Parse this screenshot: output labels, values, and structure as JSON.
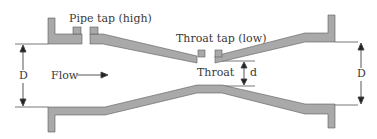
{
  "diagram": {
    "type": "venturi-meter-cross-section",
    "labels": {
      "pipe_tap": "Pipe tap (high)",
      "throat_tap": "Throat tap (low)",
      "flow": "Flow",
      "throat": "Throat",
      "inlet_diameter": "D",
      "outlet_diameter": "D",
      "throat_diameter": "d"
    },
    "colors": {
      "wall_fill": "#a9a9a9",
      "wall_stroke": "#5a5a5a",
      "line": "#555555",
      "text": "#3a3a3a"
    }
  }
}
